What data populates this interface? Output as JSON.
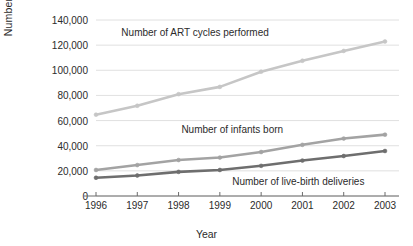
{
  "chart_data": {
    "type": "line",
    "title": "",
    "xlabel": "Year",
    "ylabel": "Number",
    "x": [
      1996,
      1997,
      1998,
      1999,
      2000,
      2001,
      2002,
      2003
    ],
    "categories": [
      "1996",
      "1997",
      "1998",
      "1999",
      "2000",
      "2001",
      "2002",
      "2003"
    ],
    "xlim": [
      1996,
      2003
    ],
    "ylim": [
      0,
      140000
    ],
    "yticks": [
      0,
      20000,
      40000,
      60000,
      80000,
      100000,
      120000,
      140000
    ],
    "ytick_labels": [
      "0",
      "20,000",
      "40,000",
      "60,000",
      "80,000",
      "100,000",
      "120,000",
      "140,000"
    ],
    "grid": true,
    "legend_position": "inline-annotations",
    "series": [
      {
        "name": "Number of ART cycles performed",
        "color": "#c6c6c6",
        "values": [
          64700,
          71800,
          81000,
          86800,
          98900,
          107600,
          115400,
          122900
        ]
      },
      {
        "name": "Number of infants born",
        "color": "#a3a3a3",
        "values": [
          20700,
          24600,
          28600,
          30600,
          35000,
          40700,
          45700,
          48800
        ]
      },
      {
        "name": "Number of live-birth deliveries",
        "color": "#6e6e6e",
        "values": [
          14500,
          16300,
          19200,
          20700,
          24000,
          28200,
          31800,
          35800
        ]
      }
    ],
    "annotations": [
      {
        "text": "Number of ART cycles performed",
        "x": 1998.4,
        "y": 128500
      },
      {
        "text": "Number of infants born",
        "x": 1999.3,
        "y": 52000
      },
      {
        "text": "Number of live-birth deliveries",
        "x": 2000.9,
        "y": 10500
      }
    ]
  },
  "axis": {
    "y_title": "Number",
    "x_title": "Year"
  }
}
